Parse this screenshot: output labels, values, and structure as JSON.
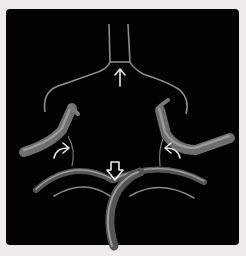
{
  "figure": {
    "background": "#020202",
    "border": "#ecebea",
    "vessel_color": "#8a8a8a",
    "arrow_color": "#e8e8e8",
    "arrows": [
      {
        "type": "thin-up",
        "position": "top-center"
      },
      {
        "type": "curved",
        "position": "left-middle"
      },
      {
        "type": "hollow-down",
        "position": "center-lower"
      },
      {
        "type": "curved",
        "position": "right-middle"
      }
    ]
  }
}
